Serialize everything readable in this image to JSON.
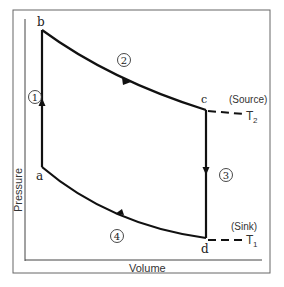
{
  "diagram": {
    "type": "p-v cycle",
    "axes": {
      "xlabel": "Volume",
      "ylabel": "Pressure"
    },
    "points": {
      "a": {
        "label": "a",
        "x": 42,
        "y": 167
      },
      "b": {
        "label": "b",
        "x": 42,
        "y": 30
      },
      "c": {
        "label": "c",
        "x": 206,
        "y": 110
      },
      "d": {
        "label": "d",
        "x": 206,
        "y": 238
      }
    },
    "processes": [
      {
        "id": "1",
        "label": "1",
        "from": "a",
        "to": "b",
        "shape": "vertical line, arrow up"
      },
      {
        "id": "2",
        "label": "2",
        "from": "b",
        "to": "c",
        "shape": "curve, arrow right"
      },
      {
        "id": "3",
        "label": "3",
        "from": "c",
        "to": "d",
        "shape": "vertical line, arrow down"
      },
      {
        "id": "4",
        "label": "4",
        "from": "d",
        "to": "a",
        "shape": "curve, arrow left"
      }
    ],
    "reservoirs": {
      "source": {
        "label": "(Source)",
        "temp_label": "T",
        "temp_sub": "2"
      },
      "sink": {
        "label": "(Sink)",
        "temp_label": "T",
        "temp_sub": "1"
      }
    },
    "colors": {
      "line": "#1a1a1a",
      "frame": "#555555",
      "text": "#222222"
    }
  }
}
